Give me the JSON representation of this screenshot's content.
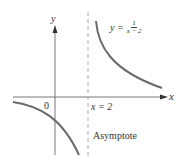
{
  "diagram": {
    "function_label": {
      "lhs": "y =",
      "numerator": "1",
      "denominator": "x − 2"
    },
    "axes": {
      "x_label": "x",
      "y_label": "y",
      "origin_label": "0"
    },
    "asymptote": {
      "equation": "x = 2",
      "label": "Asymptote"
    },
    "colors": {
      "curve": "#6b6b6b",
      "axis": "#555555",
      "asymptote": "#999999",
      "text": "#333333"
    }
  }
}
